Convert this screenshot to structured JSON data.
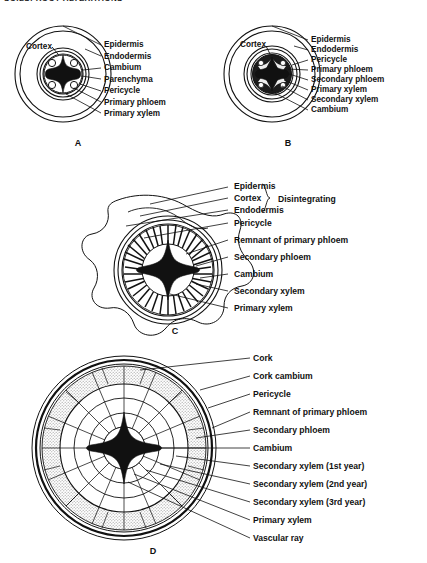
{
  "page": {
    "header_text": "SOILS: ROOT ALTERATIONS",
    "background_color": "#ffffff",
    "ink_color": "#111111",
    "stipple_color": "#b9b9b9"
  },
  "figure": {
    "panels": [
      {
        "id": "A",
        "letter": "A",
        "caption": "Young dicot root, primary structure",
        "inner_label": "Cortex",
        "labels": [
          "Epidermis",
          "Endodermis",
          "Cambium",
          "Parenchyma",
          "Pericycle",
          "Primary phloem",
          "Primary xylem"
        ]
      },
      {
        "id": "B",
        "letter": "B",
        "caption": "Root beginning secondary growth",
        "inner_label": "Cortex",
        "labels": [
          "Epidermis",
          "Endodermis",
          "Pericycle",
          "Primary phloem",
          "Secondary phloem",
          "Primary xylem",
          "Secondary xylem",
          "Cambium"
        ]
      },
      {
        "id": "C",
        "letter": "C",
        "caption": "Root with disintegrating cortex",
        "bracket_note": "Disintegrating",
        "bracket_labels": [
          "Epidermis",
          "Cortex",
          "Endodermis"
        ],
        "labels": [
          "Epidermis",
          "Cortex",
          "Endodermis",
          "Pericycle",
          "Remnant of primary phloem",
          "Secondary phloem",
          "Cambium",
          "Secondary xylem",
          "Primary xylem"
        ]
      },
      {
        "id": "D",
        "letter": "D",
        "caption": "Older woody root with three annual rings",
        "labels": [
          "Cork",
          "Cork cambium",
          "Pericycle",
          "Remnant of primary phloem",
          "Secondary phloem",
          "Cambium",
          "Secondary xylem (1st year)",
          "Secondary xylem (2nd year)",
          "Secondary xylem (3rd year)",
          "Primary xylem",
          "Vascular ray"
        ]
      }
    ]
  }
}
